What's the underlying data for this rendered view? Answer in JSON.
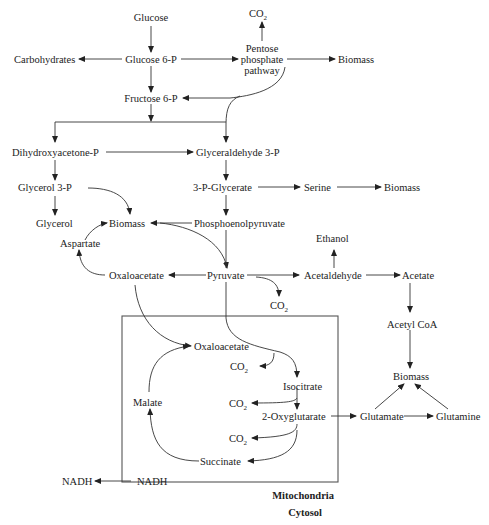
{
  "diagram": {
    "compartments": {
      "mitochondria": "Mitochondria",
      "cytosol": "Cytosol"
    },
    "nodes": {
      "glucose": "Glucose",
      "co2_ppp": "CO",
      "co2_sub": "2",
      "carbohydrates": "Carbohydrates",
      "glucose6p": "Glucose 6-P",
      "ppp_line1": "Pentose",
      "ppp_line2": "phosphate",
      "ppp_line3": "pathway",
      "biomass_ppp": "Biomass",
      "fructose6p": "Fructose 6-P",
      "dhap": "Dihydroxyacetone-P",
      "g3p": "Glyceraldehyde 3-P",
      "glycerol3p": "Glycerol 3-P",
      "pg3": "3-P-Glycerate",
      "serine": "Serine",
      "biomass_serine": "Biomass",
      "glycerol": "Glycerol",
      "biomass_center": "Biomass",
      "pep": "Phosphoenolpyruvate",
      "aspartate": "Aspartate",
      "ethanol": "Ethanol",
      "oaa_cyto": "Oxaloacetate",
      "pyruvate": "Pyruvate",
      "acetaldehyde": "Acetaldehyde",
      "acetate": "Acetate",
      "co2_pyr": "CO",
      "acetylcoa": "Acetyl CoA",
      "oaa_mito": "Oxaloacetate",
      "co2_oaa": "CO",
      "biomass_glu": "Biomass",
      "isocitrate": "Isocitrate",
      "malate": "Malate",
      "co2_iso": "CO",
      "oxoglutarate": "2-Oxyglutarate",
      "glutamate": "Glutamate",
      "glutamine": "Glutamine",
      "co2_oxo": "CO",
      "succinate": "Succinate",
      "nadh_cyto": "NADH",
      "nadh_mito": "NADH"
    }
  }
}
